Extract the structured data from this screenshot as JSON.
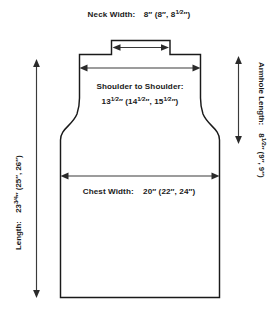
{
  "diagram": {
    "type": "sweater-front-schematic",
    "colors": {
      "outline": "#1a1a1a",
      "dimension_line": "#3a3a3a",
      "text": "#1a1a1a",
      "background": "#ffffff"
    },
    "measurements": {
      "neck_width": {
        "label": "Neck Width:",
        "value": "8″ (8″, 8",
        "value_fraction": "1/2",
        "value_tail": "″)",
        "full_text": "Neck Width:   8″ (8″, 8½″)",
        "sizes": [
          "8″",
          "8″",
          "8½″"
        ],
        "orientation": "horizontal",
        "position": "top"
      },
      "shoulder_to_shoulder": {
        "label": "Shoulder to Shoulder:",
        "value_lead": "13",
        "value_frac1": "1/2",
        "value_mid": "″ (14",
        "value_frac2": "1/2",
        "value_mid2": "″, 15",
        "value_frac3": "1/2",
        "value_tail": "″)",
        "full_text": "13½″ (14½″, 15½″)",
        "sizes": [
          "13½″",
          "14½″",
          "15½″"
        ],
        "orientation": "horizontal",
        "position": "upper-body"
      },
      "chest_width": {
        "label": "Chest Width:",
        "value": "20″ (22″, 24″)",
        "full_text": "Chest Width:   20″ (22″, 24″)",
        "sizes": [
          "20″",
          "22″",
          "24″"
        ],
        "orientation": "horizontal",
        "position": "mid-body"
      },
      "length": {
        "label": "Length:",
        "value_lead": "23",
        "value_frac": "3/4",
        "value_tail": "″ (25″, 26″)",
        "full_text": "Length:   23¾″ (25″, 26″)",
        "sizes": [
          "23¾″",
          "25″",
          "26″"
        ],
        "orientation": "vertical-bottom-to-top",
        "position": "left"
      },
      "armhole_length": {
        "label": "Armhole Length:",
        "value_lead": "8",
        "value_frac": "1/2",
        "value_tail": "″ (9″, 9″)",
        "full_text": "Armhole Length:   8½″ (9″, 9″)",
        "sizes": [
          "8½″",
          "9″",
          "9″"
        ],
        "orientation": "vertical-top-to-bottom",
        "position": "right"
      }
    }
  }
}
